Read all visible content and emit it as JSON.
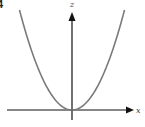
{
  "figure_label": "4",
  "chart_data": {
    "type": "line",
    "title": "",
    "xlabel": "x",
    "ylabel": "z",
    "function": "z = x^2",
    "xlim": [
      -1.45,
      1.45
    ],
    "ylim": [
      0,
      2
    ],
    "grid": false,
    "series": [
      {
        "name": "z = x^2",
        "color": "#7a7a7a",
        "x": [
          -1.4,
          -1.2,
          -1.0,
          -0.8,
          -0.6,
          -0.4,
          -0.2,
          0,
          0.2,
          0.4,
          0.6,
          0.8,
          1.0,
          1.2,
          1.4
        ],
        "y": [
          1.96,
          1.44,
          1.0,
          0.64,
          0.36,
          0.16,
          0.04,
          0,
          0.04,
          0.16,
          0.36,
          0.64,
          1.0,
          1.44,
          1.96
        ]
      }
    ],
    "axis_color": "#111111"
  }
}
